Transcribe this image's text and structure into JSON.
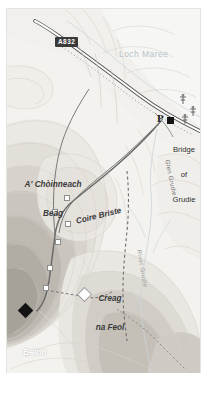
{
  "map": {
    "title": "Beinn a' Chearcaill walking route map",
    "region": "Loch Maree, Torridon, Scotland",
    "frame": {
      "width": 193,
      "height": 364
    },
    "colors": {
      "paper": "#f2f1ee",
      "water_label": "#b9c4cb",
      "contour_line": "#d8d4cc",
      "road_casing": "#5a5a5a",
      "road_fill": "#ffffff",
      "route_line": "#6d6d6d",
      "shield_bg": "#3a3a3a",
      "summit_marker": "#121212",
      "shade_light": "#e7e5e0",
      "shade_mid": "#d2cfc9",
      "shade_dark": "#b9b5ae",
      "shade_darkest": "#a39f98"
    }
  },
  "labels": {
    "water": {
      "name": "Loch Maree"
    },
    "road_shield": {
      "number": "A832"
    },
    "parking": {
      "symbol": "P"
    },
    "place_bridge": {
      "line1": "Bridge",
      "line2": "of",
      "line3": "Grudie"
    },
    "hill_choinneach": {
      "line1": "A' Chòinneach",
      "line2": "Beag"
    },
    "corrie": {
      "name": "Coire Briste"
    },
    "crag": {
      "line1": "Creag",
      "line2": "na Feol"
    },
    "summit": {
      "line1": "Beinn",
      "line2": "a' Chearcaill"
    },
    "glen": {
      "name": "Glen Grudie"
    },
    "river": {
      "name": "River Grudie"
    }
  },
  "symbols": {
    "summit_marker": "black-diamond",
    "crag_marker": "white-diamond",
    "parking_marker": "parking-p",
    "tree_1": "conifer-tree",
    "tree_2": "conifer-tree",
    "tree_3": "conifer-tree",
    "waypoints": [
      "waypoint-1",
      "waypoint-2",
      "waypoint-3",
      "waypoint-4",
      "waypoint-5",
      "waypoint-6"
    ]
  },
  "features": {
    "road": "A832 trunk road along the north-east shore of Loch Maree",
    "route_solid": "walkers route from Bridge of Grudie car park",
    "route_dashed": "dashed path continuing south through Glen Grudie",
    "water_body": "Loch Maree",
    "watercourse": "River Grudie"
  }
}
